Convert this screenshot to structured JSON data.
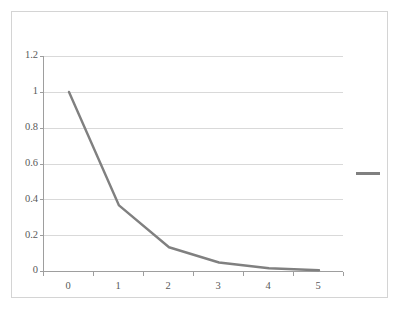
{
  "chart_data": {
    "type": "line",
    "title": "",
    "subtitle": "",
    "xlabel": "",
    "ylabel": "",
    "x": [
      0,
      1,
      2,
      3,
      4,
      5
    ],
    "categories": [
      "0",
      "1",
      "2",
      "3",
      "4",
      "5"
    ],
    "series": [
      {
        "name": "",
        "color": "#808080",
        "values": [
          1,
          0.368,
          0.135,
          0.05,
          0.018,
          0.007
        ]
      }
    ],
    "ylim": [
      0,
      1.2
    ],
    "xlim": [
      0,
      5
    ],
    "yticks": [
      0,
      0.2,
      0.4,
      0.6,
      0.8,
      1,
      1.2
    ],
    "ytick_labels": [
      "0",
      "0.2",
      "0.4",
      "0.6",
      "0.8",
      "1",
      "1.2"
    ],
    "xtick_labels": [
      "0",
      "1",
      "2",
      "3",
      "4",
      "5"
    ],
    "grid": "horizontal",
    "legend_position": "right",
    "legend_entries": [
      ""
    ]
  },
  "axes": {
    "y_ticks": [
      {
        "label": "1.2",
        "value": 1.2
      },
      {
        "label": "1",
        "value": 1
      },
      {
        "label": "0.8",
        "value": 0.8
      },
      {
        "label": "0.6",
        "value": 0.6
      },
      {
        "label": "0.4",
        "value": 0.4
      },
      {
        "label": "0.2",
        "value": 0.2
      },
      {
        "label": "0",
        "value": 0
      }
    ],
    "x_ticks": [
      {
        "label": "0",
        "value": 0
      },
      {
        "label": "1",
        "value": 1
      },
      {
        "label": "2",
        "value": 2
      },
      {
        "label": "3",
        "value": 3
      },
      {
        "label": "4",
        "value": 4
      },
      {
        "label": "5",
        "value": 5
      }
    ]
  },
  "legend": {
    "label": ""
  },
  "colors": {
    "series_line": "#808080",
    "gridline": "#d9d9d9",
    "axis_line": "#9e9e9e",
    "border": "#d4d4d4",
    "tick_text": "#595959",
    "plot_background": "#ffffff"
  }
}
